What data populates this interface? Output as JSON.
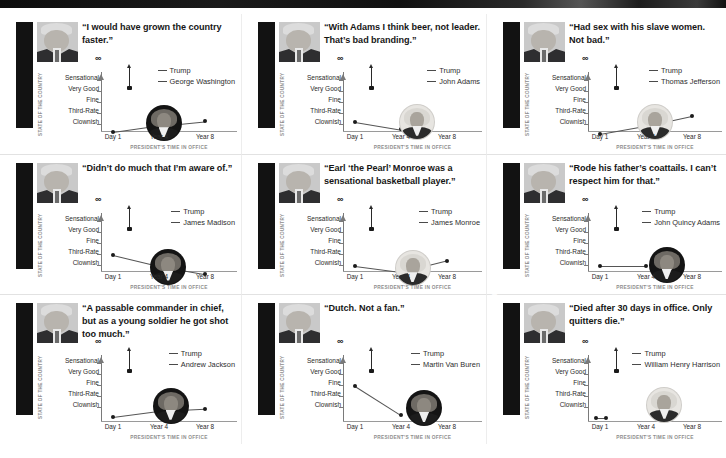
{
  "axes": {
    "y_title": "STATE OF THE COUNTRY",
    "y_ticks": [
      "Sensational",
      "Very Good",
      "Fine",
      "Third-Rate",
      "Clownish"
    ],
    "y_top_symbol": "∞",
    "x_ticks": [
      "Day 1",
      "Year 4",
      "Year 8"
    ],
    "x_title": "PRESIDENT'S TIME IN OFFICE",
    "trump_legend": "Trump"
  },
  "chart_data": {
    "type": "line",
    "xlabel": "PRESIDENT'S TIME IN OFFICE",
    "ylabel": "STATE OF THE COUNTRY",
    "x": [
      "Day 1",
      "Year 4",
      "Year 8"
    ],
    "ylim": [
      "Clownish",
      "Sensational"
    ],
    "y_categories": [
      "Clownish",
      "Third-Rate",
      "Fine",
      "Very Good",
      "Sensational",
      "∞"
    ],
    "grid": false,
    "legend_position": "top-right",
    "panels": [
      {
        "president": "GEORGE WASHINGTON",
        "legend": "George Washington",
        "quote": "“I would have grown the country faster.”",
        "series": [
          {
            "name": "Trump",
            "values": [
              "∞"
            ],
            "style": "up-arrow at Day 1"
          },
          {
            "name": "George Washington",
            "values": [
              0.35,
              0.95,
              1.35
            ]
          }
        ],
        "portrait_at": {
          "x": 2.1,
          "y": 1.15
        },
        "portrait_tone": "dark"
      },
      {
        "president": "JOHN ADAMS",
        "legend": "John Adams",
        "quote": "“With Adams I think beer, not leader. That’s bad branding.”",
        "series": [
          {
            "name": "Trump",
            "values": [
              "∞"
            ],
            "style": "up-arrow at Day 1"
          },
          {
            "name": "John Adams",
            "values": [
              1.3,
              0.6
            ]
          }
        ],
        "portrait_at": {
          "x": 2.35,
          "y": 1.3
        },
        "portrait_tone": "light"
      },
      {
        "president": "THOMAS JEFFERSON",
        "legend": "Thomas Jefferson",
        "quote": "“Had sex with his slave women. Not bad.”",
        "series": [
          {
            "name": "Trump",
            "values": [
              "∞"
            ],
            "style": "up-arrow at Day 1"
          },
          {
            "name": "Thomas Jefferson",
            "values": [
              0.2,
              0.95,
              1.85
            ]
          }
        ],
        "portrait_at": {
          "x": 2.2,
          "y": 1.3
        },
        "portrait_tone": "light"
      },
      {
        "president": "JAMES MADISON",
        "legend": "James Madison",
        "quote": "“Didn’t do much that I’m aware of.”",
        "series": [
          {
            "name": "Trump",
            "values": [
              "∞"
            ],
            "style": "up-arrow at Day 1"
          },
          {
            "name": "James Madison",
            "values": [
              2.0,
              1.0,
              0.25
            ]
          }
        ],
        "portrait_at": {
          "x": 2.2,
          "y": 0.95
        },
        "portrait_tone": "dark"
      },
      {
        "president": "JAMES MONROE",
        "legend": "James Monroe",
        "quote": "“Earl ‘the Pearl’ Monroe was a sensational basketball player.”",
        "series": [
          {
            "name": "Trump",
            "values": [
              "∞"
            ],
            "style": "up-arrow at Day 1"
          },
          {
            "name": "James Monroe",
            "values": [
              1.0,
              0.45,
              1.5
            ]
          }
        ],
        "portrait_at": {
          "x": 2.25,
          "y": 0.8
        },
        "portrait_tone": "light"
      },
      {
        "president": "JOHN QUINCY ADAMS",
        "legend": "John Quincy Adams",
        "quote": "“Rode his father’s coattails. I can’t respect him for that.”",
        "series": [
          {
            "name": "Trump",
            "values": [
              "∞"
            ],
            "style": "up-arrow at Day 1"
          },
          {
            "name": "John Quincy Adams",
            "values": [
              1.0,
              1.0
            ]
          }
        ],
        "portrait_at": {
          "x": 2.45,
          "y": 1.1
        },
        "portrait_tone": "dark"
      },
      {
        "president": "ANDREW JACKSON",
        "legend": "Andrew Jackson",
        "quote": "“A passable commander in chief, but as a young soldier he got shot too much.”",
        "series": [
          {
            "name": "Trump",
            "values": [
              "∞"
            ],
            "style": "up-arrow at Day 1"
          },
          {
            "name": "Andrew Jackson",
            "values": [
              0.2,
              0.75,
              0.95
            ]
          }
        ],
        "portrait_at": {
          "x": 2.25,
          "y": 1.2
        },
        "portrait_tone": "dark"
      },
      {
        "president": "MARTIN VAN BUREN",
        "legend": "Martin Van Buren",
        "quote": "“Dutch. Not a fan.”",
        "series": [
          {
            "name": "Trump",
            "values": [
              "∞"
            ],
            "style": "up-arrow at Day 1"
          },
          {
            "name": "Martin Van Buren",
            "values": [
              3.0,
              0.35
            ]
          }
        ],
        "portrait_at": {
          "x": 2.5,
          "y": 1.0
        },
        "portrait_tone": "dark"
      },
      {
        "president": "WILLIAM HENRY HARRISON",
        "legend": "William Henry Harrison",
        "quote": "“Died after 30 days in office. Only quitters die.”",
        "series": [
          {
            "name": "Trump",
            "values": [
              "∞"
            ],
            "style": "up-arrow at Day 1"
          },
          {
            "name": "William Henry Harrison",
            "values": [
              0.05,
              0.05
            ],
            "x_span": [
              0.92,
              1.12
            ]
          }
        ],
        "portrait_at": {
          "x": 2.4,
          "y": 1.3
        },
        "portrait_tone": "light"
      }
    ]
  }
}
